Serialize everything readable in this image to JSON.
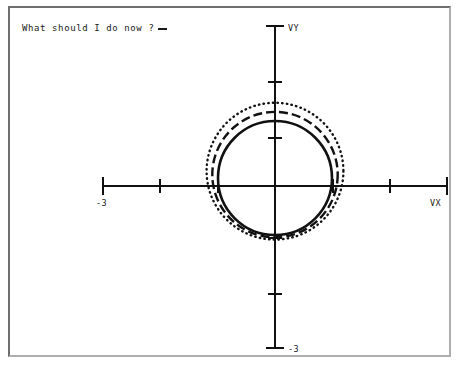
{
  "window": {
    "title": "",
    "frame_color": "#6e6e6e",
    "background": "#ffffff"
  },
  "terminal": {
    "prompt_text": "What should I do now ?",
    "cursor": "_"
  },
  "chart_data": {
    "type": "line",
    "title": "",
    "xlabel": "VX",
    "ylabel": "VY",
    "xlim": [
      -3.4,
      3.4
    ],
    "ylim": [
      -3.4,
      3.4
    ],
    "grid": false,
    "legend": null,
    "axis_style": "centered-cross-with-ticks",
    "xticks": [
      -3,
      -2,
      -1,
      1,
      2,
      3
    ],
    "yticks": [
      -3,
      -2,
      -1,
      1,
      2,
      3
    ],
    "xtick_labels": {
      "-3": "-3"
    },
    "ytick_labels": {
      "-3": "-3"
    },
    "axis_end_labels": {
      "x": "VX",
      "y": "VY"
    },
    "units_per_tick": 1,
    "series": [
      {
        "name": "trajectory-inner",
        "style": "solid",
        "color": "#111111",
        "shape": "circle",
        "center": [
          0.0,
          0.14
        ],
        "radius": 1.0,
        "closed": true
      },
      {
        "name": "trajectory-middle",
        "style": "dashed",
        "color": "#111111",
        "shape": "circle",
        "center": [
          0.0,
          0.2
        ],
        "radius": 1.1,
        "closed": true
      },
      {
        "name": "trajectory-outer",
        "style": "dotted",
        "color": "#111111",
        "shape": "circle",
        "center": [
          0.0,
          0.26
        ],
        "radius": 1.2,
        "closed": true
      }
    ]
  }
}
